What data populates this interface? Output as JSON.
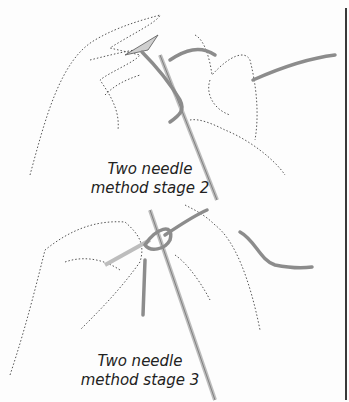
{
  "figures": [
    {
      "id": "stage-2",
      "caption_line1": "Two needle",
      "caption_line2": "method stage 2"
    },
    {
      "id": "stage-3",
      "caption_line1": "Two needle",
      "caption_line2": "method stage 3"
    }
  ],
  "colors": {
    "yarn": "#8c8c8c",
    "needle": "#cfcfcf",
    "ink": "#444444",
    "rule": "#3a3a3a"
  }
}
